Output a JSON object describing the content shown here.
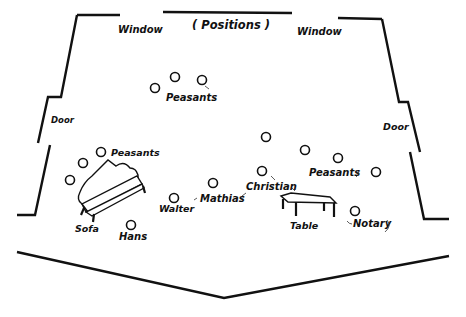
{
  "diagram": {
    "title": "( Positions )",
    "colors": {
      "ink": "#111111",
      "paper": "#ffffff"
    },
    "labels": {
      "window_left": "Window",
      "window_right": "Window",
      "door_left": "Door",
      "door_right": "Door",
      "sofa": "Sofa",
      "table": "Table",
      "peasants_top": "Peasants",
      "peasants_sofa": "Peasants",
      "peasants_right": "Peasants",
      "hans": "Hans",
      "walter": "Walter",
      "mathias": "Mathias",
      "christian": "Christian",
      "notary": "Notary"
    },
    "positions": [
      {
        "name": "peasant-top-1",
        "x": 155,
        "y": 88
      },
      {
        "name": "peasant-top-2",
        "x": 175,
        "y": 77
      },
      {
        "name": "peasant-top-3",
        "x": 202,
        "y": 80
      },
      {
        "name": "peasant-sofa-1",
        "x": 101,
        "y": 152
      },
      {
        "name": "peasant-sofa-2",
        "x": 83,
        "y": 163
      },
      {
        "name": "peasant-sofa-3",
        "x": 70,
        "y": 180
      },
      {
        "name": "hans",
        "x": 131,
        "y": 225
      },
      {
        "name": "walter",
        "x": 174,
        "y": 198
      },
      {
        "name": "mathias",
        "x": 213,
        "y": 183
      },
      {
        "name": "christian",
        "x": 262,
        "y": 171
      },
      {
        "name": "peasant-right-1",
        "x": 266,
        "y": 137
      },
      {
        "name": "peasant-right-2",
        "x": 305,
        "y": 150
      },
      {
        "name": "peasant-right-3",
        "x": 338,
        "y": 158
      },
      {
        "name": "peasant-right-4",
        "x": 376,
        "y": 172
      },
      {
        "name": "notary",
        "x": 355,
        "y": 211
      }
    ]
  }
}
